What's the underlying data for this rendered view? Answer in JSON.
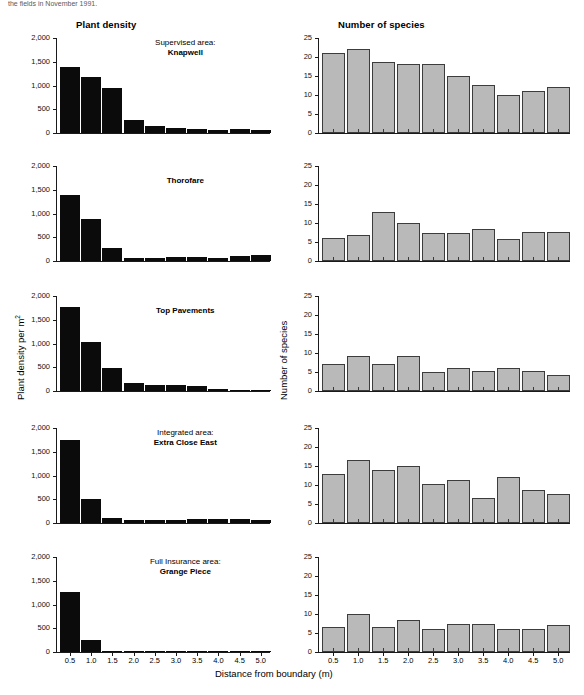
{
  "figure": {
    "cut_header_text": "the fields in November 1991.",
    "column_titles": {
      "left": "Plant density",
      "right": "Number of species"
    },
    "axis_labels": {
      "y_left": "Plant density per m",
      "y_left_sup": "2",
      "y_right": "Number of species",
      "x": "Distance from boundary (m)"
    },
    "colors": {
      "density_bar": "#0b0b0b",
      "species_bar": "#b9b9b9",
      "species_bar_border": "#3c3c3c",
      "axis": "#1a1a1a"
    }
  },
  "chart_data": [
    {
      "type": "bar",
      "title": "Knapwell",
      "subtitle": "Supervised area:",
      "panel": "left",
      "row": 1,
      "xlabel": "Distance from boundary (m)",
      "ylabel": "Plant density per m2",
      "categories": [
        "0.5",
        "1.0",
        "1.5",
        "2.0",
        "2.5",
        "3.0",
        "3.5",
        "4.0",
        "4.5",
        "5.0"
      ],
      "values": [
        1400,
        1185,
        950,
        280,
        150,
        100,
        80,
        70,
        90,
        55
      ],
      "ylim": [
        0,
        2000
      ],
      "yticks": [
        0,
        500,
        1000,
        1500,
        2000
      ],
      "ytick_labels": [
        "0",
        "500",
        "1,000",
        "1,500",
        "2,000"
      ],
      "grid": false,
      "legend": "none"
    },
    {
      "type": "bar",
      "title": "Knapwell",
      "subtitle": "Supervised area:",
      "panel": "right",
      "row": 1,
      "xlabel": "Distance from boundary (m)",
      "ylabel": "Number of species",
      "categories": [
        "0.5",
        "1.0",
        "1.5",
        "2.0",
        "2.5",
        "3.0",
        "3.5",
        "4.0",
        "4.5",
        "5.0"
      ],
      "values": [
        21,
        22.2,
        18.8,
        18.1,
        18.1,
        15.1,
        12.6,
        10.1,
        11,
        12
      ],
      "ylim": [
        0,
        25
      ],
      "yticks": [
        0,
        5,
        10,
        15,
        20,
        25
      ],
      "ytick_labels": [
        "0",
        "5",
        "10",
        "15",
        "20",
        "25"
      ],
      "grid": false,
      "legend": "none"
    },
    {
      "type": "bar",
      "title": "Thorofare",
      "subtitle": "",
      "panel": "left",
      "row": 2,
      "xlabel": "Distance from boundary (m)",
      "ylabel": "Plant density per m2",
      "categories": [
        "0.5",
        "1.0",
        "1.5",
        "2.0",
        "2.5",
        "3.0",
        "3.5",
        "4.0",
        "4.5",
        "5.0"
      ],
      "values": [
        1380,
        880,
        270,
        70,
        55,
        75,
        75,
        55,
        95,
        120
      ],
      "ylim": [
        0,
        2000
      ],
      "yticks": [
        0,
        500,
        1000,
        1500,
        2000
      ],
      "ytick_labels": [
        "0",
        "500",
        "1,000",
        "1,500",
        "2,000"
      ],
      "grid": false,
      "legend": "none"
    },
    {
      "type": "bar",
      "title": "Thorofare",
      "subtitle": "",
      "panel": "right",
      "row": 2,
      "xlabel": "Distance from boundary (m)",
      "ylabel": "Number of species",
      "categories": [
        "0.5",
        "1.0",
        "1.5",
        "2.0",
        "2.5",
        "3.0",
        "3.5",
        "4.0",
        "4.5",
        "5.0"
      ],
      "values": [
        6,
        6.9,
        13,
        9.9,
        7.5,
        7.5,
        8.5,
        5.7,
        7.6,
        7.6
      ],
      "ylim": [
        0,
        25
      ],
      "yticks": [
        0,
        5,
        10,
        15,
        20,
        25
      ],
      "ytick_labels": [
        "0",
        "5",
        "10",
        "15",
        "20",
        "25"
      ],
      "grid": false,
      "legend": "none"
    },
    {
      "type": "bar",
      "title": "Top Pavements",
      "subtitle": "",
      "panel": "left",
      "row": 3,
      "xlabel": "Distance from boundary (m)",
      "ylabel": "Plant density per m2",
      "categories": [
        "0.5",
        "1.0",
        "1.5",
        "2.0",
        "2.5",
        "3.0",
        "3.5",
        "4.0",
        "4.5",
        "5.0"
      ],
      "values": [
        1765,
        1030,
        475,
        160,
        120,
        120,
        105,
        40,
        5,
        5
      ],
      "ylim": [
        0,
        2000
      ],
      "yticks": [
        0,
        500,
        1000,
        1500,
        2000
      ],
      "ytick_labels": [
        "0",
        "500",
        "1,000",
        "1,500",
        "2,000"
      ],
      "grid": false,
      "legend": "none"
    },
    {
      "type": "bar",
      "title": "Top Pavements",
      "subtitle": "",
      "panel": "right",
      "row": 3,
      "xlabel": "Distance from boundary (m)",
      "ylabel": "Number of species",
      "categories": [
        "0.5",
        "1.0",
        "1.5",
        "2.0",
        "2.5",
        "3.0",
        "3.5",
        "4.0",
        "4.5",
        "5.0"
      ],
      "values": [
        7,
        9.2,
        7.1,
        9.2,
        5.1,
        6,
        5.2,
        6.1,
        5.2,
        4.1
      ],
      "ylim": [
        0,
        25
      ],
      "yticks": [
        0,
        5,
        10,
        15,
        20,
        25
      ],
      "ytick_labels": [
        "0",
        "5",
        "10",
        "15",
        "20",
        "25"
      ],
      "grid": false,
      "legend": "none"
    },
    {
      "type": "bar",
      "title": "Extra Close East",
      "subtitle": "Integrated area:",
      "panel": "left",
      "row": 4,
      "xlabel": "Distance from boundary (m)",
      "ylabel": "Plant density per m2",
      "categories": [
        "0.5",
        "1.0",
        "1.5",
        "2.0",
        "2.5",
        "3.0",
        "3.5",
        "4.0",
        "4.5",
        "5.0"
      ],
      "values": [
        1745,
        510,
        115,
        60,
        60,
        70,
        75,
        90,
        75,
        70
      ],
      "ylim": [
        0,
        2000
      ],
      "yticks": [
        0,
        500,
        1000,
        1500,
        2000
      ],
      "ytick_labels": [
        "0",
        "500",
        "1,000",
        "1,500",
        "2,000"
      ],
      "grid": false,
      "legend": "none"
    },
    {
      "type": "bar",
      "title": "Extra Close East",
      "subtitle": "Integrated area:",
      "panel": "right",
      "row": 4,
      "xlabel": "Distance from boundary (m)",
      "ylabel": "Number of species",
      "categories": [
        "0.5",
        "1.0",
        "1.5",
        "2.0",
        "2.5",
        "3.0",
        "3.5",
        "4.0",
        "4.5",
        "5.0"
      ],
      "values": [
        13,
        16.7,
        14,
        15.1,
        10.2,
        11.3,
        6.5,
        12,
        8.7,
        7.6
      ],
      "ylim": [
        0,
        25
      ],
      "yticks": [
        0,
        5,
        10,
        15,
        20,
        25
      ],
      "ytick_labels": [
        "0",
        "5",
        "10",
        "15",
        "20",
        "25"
      ],
      "grid": false,
      "legend": "none"
    },
    {
      "type": "bar",
      "title": "Grange Piece",
      "subtitle": "Full Insurance area:",
      "panel": "left",
      "row": 5,
      "xlabel": "Distance from boundary (m)",
      "ylabel": "Plant density per m2",
      "categories": [
        "0.5",
        "1.0",
        "1.5",
        "2.0",
        "2.5",
        "3.0",
        "3.5",
        "4.0",
        "4.5",
        "5.0"
      ],
      "values": [
        1255,
        250,
        8,
        25,
        20,
        20,
        20,
        25,
        25,
        25
      ],
      "ylim": [
        0,
        2000
      ],
      "yticks": [
        0,
        500,
        1000,
        1500,
        2000
      ],
      "ytick_labels": [
        "0",
        "500",
        "1,000",
        "1,500",
        "2,000"
      ],
      "grid": false,
      "legend": "none"
    },
    {
      "type": "bar",
      "title": "Grange Piece",
      "subtitle": "Full Insurance area:",
      "panel": "right",
      "row": 5,
      "xlabel": "Distance from boundary (m)",
      "ylabel": "Number of species",
      "categories": [
        "0.5",
        "1.0",
        "1.5",
        "2.0",
        "2.5",
        "3.0",
        "3.5",
        "4.0",
        "4.5",
        "5.0"
      ],
      "values": [
        6.6,
        10,
        6.6,
        8.5,
        6.1,
        7.5,
        7.5,
        6.1,
        6.1,
        7.2
      ],
      "ylim": [
        0,
        25
      ],
      "yticks": [
        0,
        5,
        10,
        15,
        20,
        25
      ],
      "ytick_labels": [
        "0",
        "5",
        "10",
        "15",
        "20",
        "25"
      ],
      "grid": false,
      "legend": "none"
    }
  ]
}
